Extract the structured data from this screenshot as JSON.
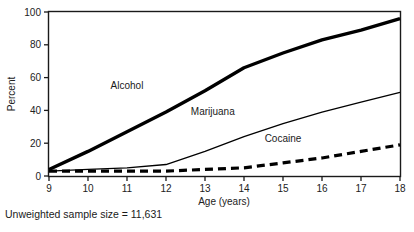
{
  "figure": {
    "footnote": "Unweighted sample size = 11,631"
  },
  "chart_data": {
    "type": "line",
    "title": "",
    "subtitle": "",
    "xlabel": "Age (years)",
    "ylabel": "Percent",
    "xlim": [
      9,
      18
    ],
    "ylim": [
      0,
      100
    ],
    "grid": false,
    "legend_position": "inline-annotations",
    "x": [
      9,
      10,
      11,
      12,
      13,
      14,
      15,
      16,
      17,
      18
    ],
    "xticks": [
      "9",
      "10",
      "11",
      "12",
      "13",
      "14",
      "15",
      "16",
      "17",
      "18"
    ],
    "yticks": [
      "0",
      "20",
      "40",
      "60",
      "80",
      "100"
    ],
    "series": [
      {
        "name": "Alcohol",
        "style": "thick-solid",
        "color": "#000000",
        "values": [
          4,
          15,
          27,
          39,
          52,
          66,
          75,
          83,
          89,
          96
        ]
      },
      {
        "name": "Marijuana",
        "style": "thin-solid",
        "color": "#000000",
        "values": [
          3,
          4,
          5,
          7,
          15,
          24,
          32,
          39,
          45,
          51
        ]
      },
      {
        "name": "Cocaine",
        "style": "dashed",
        "color": "#000000",
        "values": [
          3,
          3,
          3,
          3,
          4,
          5,
          8,
          11,
          15,
          19
        ]
      }
    ],
    "annotations": [
      {
        "text": "Alcohol",
        "x": 11.0,
        "y": 53
      },
      {
        "text": "Marijuana",
        "x": 13.2,
        "y": 37
      },
      {
        "text": "Cocaine",
        "x": 15.0,
        "y": 21
      }
    ]
  }
}
